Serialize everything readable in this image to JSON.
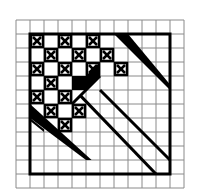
{
  "diagram": {
    "grid": {
      "origin_x": 16,
      "origin_y": 20,
      "cell": 14,
      "cols": 12,
      "rows": 12,
      "line_color": "#8a8a8a"
    },
    "border": {
      "col": 1,
      "row": 1,
      "cols": 10,
      "rows": 10,
      "color": "#000000",
      "width": 3
    },
    "ink_color": "#000000",
    "x_cells": [
      [
        1,
        1
      ],
      [
        3,
        1
      ],
      [
        5,
        1
      ],
      [
        2,
        2
      ],
      [
        4,
        2
      ],
      [
        6,
        2
      ],
      [
        1,
        3
      ],
      [
        3,
        3
      ],
      [
        5,
        3
      ],
      [
        7,
        3
      ],
      [
        2,
        4
      ],
      [
        1,
        5
      ],
      [
        3,
        5
      ],
      [
        2,
        6
      ],
      [
        4,
        6
      ],
      [
        3,
        7
      ]
    ],
    "black_cells": [
      [
        4,
        4
      ]
    ],
    "triangles": [
      {
        "name": "upper-right-large-triangle",
        "points": [
          [
            7,
            1
          ],
          [
            7,
            2
          ],
          [
            8,
            2
          ]
        ]
      },
      {
        "name": "upper-right-diagonal-band",
        "points": [
          [
            7,
            1
          ],
          [
            11,
            5
          ],
          [
            11,
            5.3
          ],
          [
            7,
            1.4
          ]
        ]
      },
      {
        "name": "center-triangle",
        "points": [
          [
            6,
            4
          ],
          [
            6,
            5
          ],
          [
            5,
            5
          ]
        ]
      },
      {
        "name": "left-lower-triangle",
        "points": [
          [
            1,
            7
          ],
          [
            1,
            8
          ],
          [
            2,
            8
          ]
        ]
      },
      {
        "name": "left-lower-band",
        "points": [
          [
            1,
            7
          ],
          [
            5,
            11
          ],
          [
            5,
            10.5
          ],
          [
            1.5,
            7
          ]
        ]
      }
    ],
    "diagonal_lines": [
      {
        "from": [
          6,
          5
        ],
        "to": [
          11,
          10
        ]
      },
      {
        "from": [
          5,
          6
        ],
        "to": [
          10,
          11
        ]
      },
      {
        "from": [
          11,
          5
        ],
        "to": [
          11,
          5
        ]
      }
    ]
  }
}
